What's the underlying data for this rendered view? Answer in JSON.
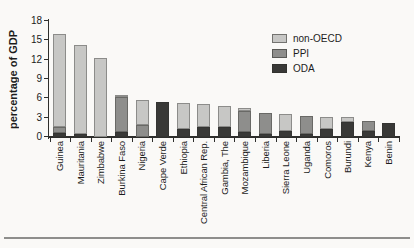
{
  "figure": {
    "ylabel": "percentage of GDP",
    "colors": {
      "axis": "#2e2e2c",
      "page_rule": "#8e8e8c",
      "background": "#faf9f7"
    }
  },
  "chart_data": {
    "type": "bar",
    "stacked": true,
    "title": "",
    "xlabel": "",
    "ylabel": "percentage of GDP",
    "ylim": [
      0,
      18
    ],
    "yticks": [
      0,
      3,
      6,
      9,
      12,
      15,
      18
    ],
    "grid": false,
    "legend_position": "top-right",
    "stack_order_bottom_to_top": [
      "ODA",
      "PPI",
      "non-OECD"
    ],
    "categories": [
      "Guinea",
      "Mauritania",
      "Zimbabwe",
      "Burkina Faso",
      "Nigeria",
      "Cape Verde",
      "Ethiopia",
      "Central African Rep.",
      "Gambia, The",
      "Mozambique",
      "Liberia",
      "Sierra Leone",
      "Uganda",
      "Comoros",
      "Burundi",
      "Kenya",
      "Benin"
    ],
    "series": [
      {
        "name": "non-OECD",
        "color": "#c7c7c5",
        "values": [
          14.5,
          13.9,
          12.2,
          0.3,
          3.9,
          0,
          4.0,
          3.5,
          3.2,
          0.4,
          0,
          2.5,
          0,
          1.9,
          0.65,
          0,
          0
        ]
      },
      {
        "name": "PPI",
        "color": "#8e8e8c",
        "values": [
          0.9,
          0,
          0,
          5.5,
          1.8,
          0,
          0,
          0,
          0,
          3.3,
          3.4,
          0,
          2.8,
          0,
          0,
          1.5,
          0
        ]
      },
      {
        "name": "ODA",
        "color": "#393937",
        "values": [
          0.6,
          0.4,
          0,
          0.7,
          0,
          5.5,
          1.2,
          1.6,
          1.6,
          0.8,
          0.4,
          1.0,
          0.5,
          1.2,
          2.4,
          1.0,
          2.1
        ]
      }
    ],
    "totals": [
      16.0,
      14.3,
      12.2,
      6.5,
      5.7,
      5.5,
      5.2,
      5.1,
      4.8,
      4.5,
      3.8,
      3.5,
      3.3,
      3.1,
      3.05,
      2.5,
      2.1
    ]
  }
}
